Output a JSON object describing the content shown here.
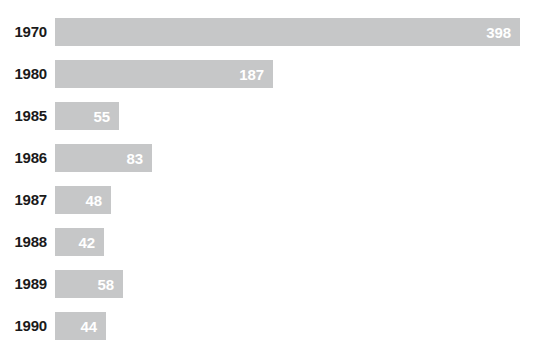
{
  "chart_data": {
    "type": "bar",
    "orientation": "horizontal",
    "title": "",
    "subtitle": "",
    "xlabel": "",
    "ylabel": "",
    "categories": [
      "1970",
      "1980",
      "1985",
      "1986",
      "1987",
      "1988",
      "1989",
      "1990"
    ],
    "values": [
      398,
      187,
      55,
      83,
      48,
      42,
      58,
      44
    ],
    "value_labels": [
      "398",
      "187",
      "55",
      "83",
      "48",
      "42",
      "58",
      "44"
    ],
    "series": [
      {
        "name": "",
        "values": [
          398,
          187,
          55,
          83,
          48,
          42,
          58,
          44
        ]
      }
    ],
    "xlim": [
      0,
      398
    ],
    "grid": false,
    "legend": false,
    "legend_position": "none",
    "bar_color": "#c6c7c8",
    "value_label_color": "#ffffff",
    "category_label_color": "#1a1a1a",
    "background_color": "#ffffff",
    "bars": [
      {
        "category": "1970",
        "value": 398,
        "label": "398"
      },
      {
        "category": "1980",
        "value": 187,
        "label": "187"
      },
      {
        "category": "1985",
        "value": 55,
        "label": "55"
      },
      {
        "category": "1986",
        "value": 83,
        "label": "83"
      },
      {
        "category": "1987",
        "value": 48,
        "label": "48"
      },
      {
        "category": "1988",
        "value": 42,
        "label": "42"
      },
      {
        "category": "1989",
        "value": 58,
        "label": "58"
      },
      {
        "category": "1990",
        "value": 44,
        "label": "44"
      }
    ]
  }
}
